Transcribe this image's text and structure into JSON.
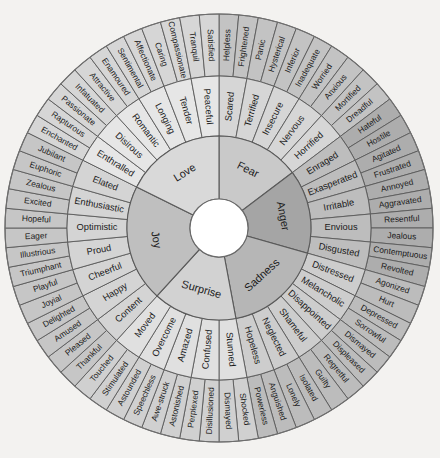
{
  "figure": {
    "background_color": "#f3f2f0",
    "hub_color": "#ffffff",
    "stroke_color": "#5a5a5a",
    "center_x": 219,
    "center_y": 228,
    "radii": {
      "hub": 29,
      "core": 92,
      "mid": 152,
      "outer": 214
    },
    "rotation_deg": -90
  },
  "chart_data": {
    "type": "pie",
    "rings": [
      "core",
      "middle",
      "outer"
    ],
    "sectors": [
      {
        "core": "Fear",
        "color": "#c9c9c9",
        "mid_color": "#d6d6d6",
        "outer_color": "#c3c3c3",
        "middle": [
          {
            "label": "Scared",
            "outer": [
              "Helpless",
              "Frightened"
            ]
          },
          {
            "label": "Terrified",
            "outer": [
              "Panic",
              "Hysterical"
            ]
          },
          {
            "label": "Insecure",
            "outer": [
              "Inferior",
              "Inadequate"
            ]
          },
          {
            "label": "Nervous",
            "outer": [
              "Worried",
              "Anxious"
            ]
          },
          {
            "label": "Horrified",
            "outer": [
              "Mortified",
              "Dreadful"
            ]
          }
        ]
      },
      {
        "core": "Anger",
        "color": "#a5a5a5",
        "mid_color": "#bdbdbd",
        "outer_color": "#adadad",
        "middle": [
          {
            "label": "Enraged",
            "outer": [
              "Hateful",
              "Hostile"
            ]
          },
          {
            "label": "Exasperated",
            "outer": [
              "Agitated",
              "Frustrated"
            ]
          },
          {
            "label": "Irritable",
            "outer": [
              "Annoyed",
              "Aggravated"
            ]
          },
          {
            "label": "Envious",
            "outer": [
              "Resentful",
              "Jealous"
            ]
          },
          {
            "label": "Disgusted",
            "outer": [
              "Contemptuous",
              "Revolted"
            ]
          }
        ]
      },
      {
        "core": "Sadness",
        "color": "#b6b6b6",
        "mid_color": "#cdcdcd",
        "outer_color": "#bcbcbc",
        "middle": [
          {
            "label": "Distressed",
            "outer": [
              "Agonized",
              "Hurt"
            ]
          },
          {
            "label": "Melancholic",
            "outer": [
              "Depressed",
              "Sorrowful"
            ]
          },
          {
            "label": "Disappointed",
            "outer": [
              "Dismayed",
              "Displeased"
            ]
          },
          {
            "label": "Shameful",
            "outer": [
              "Regretful",
              "Guilty"
            ]
          },
          {
            "label": "Neglected",
            "outer": [
              "Isolated",
              "Lonely"
            ]
          },
          {
            "label": "Hopeless",
            "outer": [
              "Anguished",
              "Powerless"
            ]
          }
        ]
      },
      {
        "core": "Surprise",
        "color": "#d2d2d2",
        "mid_color": "#e0e0e0",
        "outer_color": "#d0d0d0",
        "middle": [
          {
            "label": "Stunned",
            "outer": [
              "Shocked",
              "Dismayed"
            ]
          },
          {
            "label": "Confused",
            "outer": [
              "Disillusioned",
              "Perplexed"
            ]
          },
          {
            "label": "Amazed",
            "outer": [
              "Astonished",
              "Awe-struck"
            ]
          },
          {
            "label": "Overcome",
            "outer": [
              "Speechless",
              "Astounded"
            ]
          },
          {
            "label": "Moved",
            "outer": [
              "Stimulated",
              "Touched"
            ]
          }
        ]
      },
      {
        "core": "Joy",
        "color": "#bfbfbf",
        "mid_color": "#d4d4d4",
        "outer_color": "#c6c6c6",
        "middle": [
          {
            "label": "Content",
            "outer": [
              "Thankful",
              "Pleased"
            ]
          },
          {
            "label": "Happy",
            "outer": [
              "Amused",
              "Delighted"
            ]
          },
          {
            "label": "Cheerful",
            "outer": [
              "Joyial",
              "Playful"
            ]
          },
          {
            "label": "Proud",
            "outer": [
              "Triumphant",
              "Illustrious"
            ]
          },
          {
            "label": "Optimistic",
            "outer": [
              "Eager",
              "Hopeful"
            ]
          },
          {
            "label": "Enthusiastic",
            "outer": [
              "Excited",
              "Zealous"
            ]
          },
          {
            "label": "Elated",
            "outer": [
              "Euphoric",
              "Jubilant"
            ]
          }
        ]
      },
      {
        "core": "Love",
        "color": "#d9d9d9",
        "mid_color": "#e6e6e6",
        "outer_color": "#d6d6d6",
        "middle": [
          {
            "label": "Enthralled",
            "outer": [
              "Enchanted",
              "Rapturous"
            ]
          },
          {
            "label": "Disirous",
            "outer": [
              "Passionate",
              "Infatuated"
            ]
          },
          {
            "label": "Romantic",
            "outer": [
              "Attractive",
              "Enamoured"
            ]
          },
          {
            "label": "Longing",
            "outer": [
              "Sentimental",
              "Affectionate"
            ]
          },
          {
            "label": "Tender",
            "outer": [
              "Caring",
              "Compassionate"
            ]
          },
          {
            "label": "Peaceful",
            "outer": [
              "Tranquil",
              "Satisfied"
            ]
          }
        ]
      }
    ]
  }
}
